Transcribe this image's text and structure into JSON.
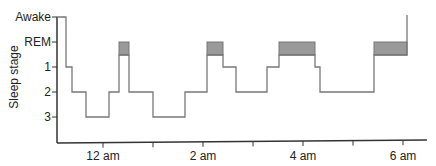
{
  "chart_data": {
    "type": "line",
    "subtype": "step",
    "title": "",
    "xlabel": "",
    "ylabel": "Sleep stage",
    "y_categories": [
      "Awake",
      "REM",
      "1",
      "2",
      "3"
    ],
    "x_ticks": [
      {
        "hour": -1,
        "label": ""
      },
      {
        "hour": 0,
        "label": "12 am"
      },
      {
        "hour": 1,
        "label": ""
      },
      {
        "hour": 2,
        "label": "2 am"
      },
      {
        "hour": 3,
        "label": ""
      },
      {
        "hour": 4,
        "label": "4 am"
      },
      {
        "hour": 5,
        "label": ""
      },
      {
        "hour": 6,
        "label": "6 am"
      }
    ],
    "x_range_hours": [
      -0.92,
      6.47
    ],
    "grid": false,
    "legend": null,
    "rem_shading_color": "#9a9a9a",
    "line_color": "#777777",
    "series": [
      {
        "name": "Sleep stage over night",
        "segments": [
          {
            "start": -0.92,
            "end": -0.74,
            "stage": "Awake"
          },
          {
            "start": -0.74,
            "end": -0.62,
            "stage": "1"
          },
          {
            "start": -0.62,
            "end": -0.34,
            "stage": "2"
          },
          {
            "start": -0.34,
            "end": 0.12,
            "stage": "3"
          },
          {
            "start": 0.12,
            "end": 0.32,
            "stage": "2"
          },
          {
            "start": 0.32,
            "end": 0.52,
            "stage": "REM"
          },
          {
            "start": 0.52,
            "end": 1.0,
            "stage": "2"
          },
          {
            "start": 1.0,
            "end": 1.64,
            "stage": "3"
          },
          {
            "start": 1.64,
            "end": 2.08,
            "stage": "2"
          },
          {
            "start": 2.08,
            "end": 2.4,
            "stage": "REM"
          },
          {
            "start": 2.4,
            "end": 2.66,
            "stage": "1"
          },
          {
            "start": 2.66,
            "end": 3.28,
            "stage": "2"
          },
          {
            "start": 3.28,
            "end": 3.52,
            "stage": "1"
          },
          {
            "start": 3.52,
            "end": 4.24,
            "stage": "REM"
          },
          {
            "start": 4.24,
            "end": 4.34,
            "stage": "1"
          },
          {
            "start": 4.34,
            "end": 5.42,
            "stage": "2"
          },
          {
            "start": 5.42,
            "end": 6.08,
            "stage": "REM"
          },
          {
            "start": 6.08,
            "end": 6.08,
            "stage": "Awake"
          }
        ]
      }
    ]
  }
}
